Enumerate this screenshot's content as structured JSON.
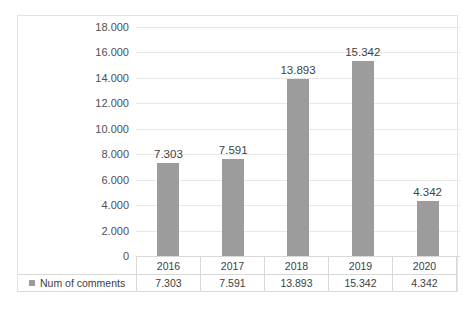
{
  "chart_data": {
    "type": "bar",
    "title": "",
    "subtitle": "",
    "xlabel": "",
    "ylabel": "",
    "categories": [
      "2016",
      "2017",
      "2018",
      "2019",
      "2020"
    ],
    "series": [
      {
        "name": "Num of comments",
        "values": [
          7303,
          7591,
          13893,
          15342,
          4342
        ],
        "value_labels": [
          "7.303",
          "7.591",
          "13.893",
          "15.342",
          "4.342"
        ],
        "color": "#9c9c9c"
      }
    ],
    "ylim": [
      0,
      18000
    ],
    "ytick_step": 2000,
    "ytick_labels": [
      "0",
      "2.000",
      "4.000",
      "6.000",
      "8.000",
      "10.000",
      "12.000",
      "14.000",
      "16.000",
      "18.000"
    ],
    "ytick_values": [
      0,
      2000,
      4000,
      6000,
      8000,
      10000,
      12000,
      14000,
      16000,
      18000
    ],
    "grid": true,
    "legend_position": "bottom-table",
    "data_table_visible": true,
    "data_labels_visible": true,
    "thousands_separator": "."
  },
  "legend": {
    "marker_name": "legend-square-marker",
    "label": "Num of comments"
  },
  "colors": {
    "bar": "#9c9c9c",
    "gridline": "#e8e8e8",
    "border": "#e3e3e3",
    "text": "#404040"
  }
}
